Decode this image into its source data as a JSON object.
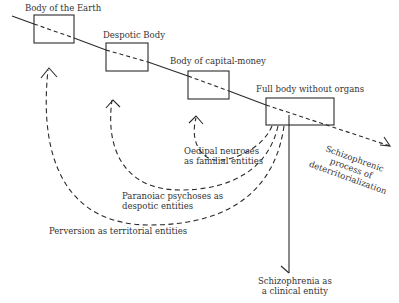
{
  "bodies": [
    {
      "label": "Body of the Earth"
    },
    {
      "label": "Despotic Body"
    },
    {
      "label": "Body of capital-money"
    },
    {
      "label": "Full body without organs"
    }
  ],
  "entities": {
    "oedipal": {
      "line1": "Oedipal neuroses",
      "line2": "as familial entities"
    },
    "paranoiac": {
      "line1": "Paranoiac psychoses as",
      "line2": "despotic entities"
    },
    "perversion": {
      "line1": "Perversion as territorial entities"
    },
    "schizophrenia": {
      "line1": "Schizophrenia as",
      "line2": "a clinical entity"
    }
  },
  "process": {
    "line1": "Schizophrenic",
    "line2": "process of",
    "line3": "deterritorialization"
  },
  "colors": {
    "stroke": "#2a2a2a",
    "background": "#ffffff"
  }
}
